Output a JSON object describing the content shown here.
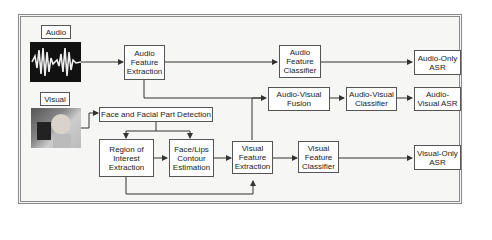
{
  "inputs": {
    "audio_label": "Audio",
    "visual_label": "Visual"
  },
  "boxes": {
    "audio_feature_extraction": "Audio\nFeature\nExtraction",
    "audio_feature_classifier": "Audio\nFeature\nClassifier",
    "audio_only_asr": "Audio-Only\nASR",
    "audio_visual_fusion": "Audio-Visual\nFusion",
    "audio_visual_classifier": "Audio-Visual\nClassifier",
    "audio_visual_asr": "Audio-\nVisual ASR",
    "face_detection": "Face and Facial Part Detection",
    "roi_extraction": "Region of\nInterest\nExtraction",
    "contour_estimation": "Face/Lips\nContour\nEstimation",
    "visual_feature_extraction": "Visual\nFeature\nExtraction",
    "visual_feature_classifier": "Visual\nFeature\nClassifier",
    "visual_only_asr": "Visual-Only\nASR"
  },
  "colors": {
    "line": "#333333",
    "frame": "#8a8a8a",
    "background": "#f6f6f4"
  }
}
